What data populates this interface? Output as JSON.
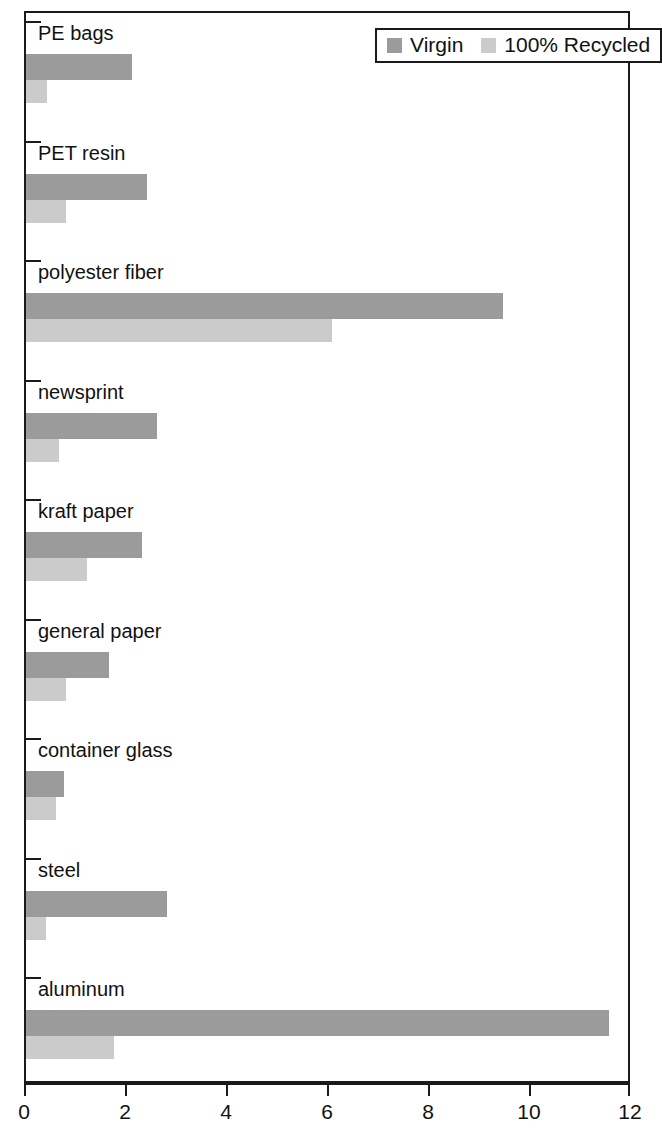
{
  "chart_data": {
    "type": "bar",
    "orientation": "horizontal",
    "title": "",
    "xlabel": "",
    "ylabel": "",
    "xlim": [
      0,
      12
    ],
    "grid": false,
    "legend_position": "top-right",
    "categories": [
      "PE bags",
      "PET resin",
      "polyester fiber",
      "newsprint",
      "kraft paper",
      "general paper",
      "container glass",
      "steel",
      "aluminum"
    ],
    "series": [
      {
        "name": "Virgin",
        "color": "#9b9b9b",
        "values": [
          2.1,
          2.4,
          9.45,
          2.6,
          2.3,
          1.65,
          0.75,
          2.8,
          11.55
        ]
      },
      {
        "name": "100% Recycled",
        "color": "#cbcbcb",
        "values": [
          0.42,
          0.8,
          6.05,
          0.65,
          1.2,
          0.8,
          0.6,
          0.4,
          1.75
        ]
      }
    ],
    "xticks": [
      0,
      2,
      4,
      6,
      8,
      10,
      12
    ],
    "xtick_labels": [
      "0",
      "2",
      "4",
      "6",
      "8",
      "10",
      "12"
    ]
  },
  "legend": {
    "entries": [
      {
        "label": "Virgin",
        "swatch": "virgin-swatch"
      },
      {
        "label": "100% Recycled",
        "swatch": "recycled-swatch"
      }
    ]
  },
  "colors": {
    "virgin": "#9b9b9b",
    "recycled": "#cbcbcb",
    "axis": "#1a1a1a",
    "background": "#ffffff"
  }
}
